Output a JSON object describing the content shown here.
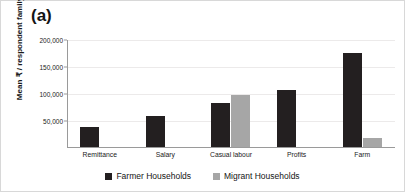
{
  "figure": {
    "panel_label": "(a)"
  },
  "chart_data": {
    "type": "bar",
    "title": "",
    "subtitle": "",
    "panel": "(a)",
    "xlabel": "",
    "ylabel": "Mean ₹ / respondent family",
    "categories": [
      "Remittance",
      "Salary",
      "Casual labour",
      "Profits",
      "Farm"
    ],
    "series": [
      {
        "name": "Farmer Households",
        "color": "#231f20",
        "values": [
          38000,
          59000,
          84000,
          108000,
          176000
        ]
      },
      {
        "name": "Migrant Households",
        "color": "#a6a6a6",
        "values": [
          null,
          null,
          99000,
          null,
          18000
        ]
      }
    ],
    "ylim": [
      0,
      200000
    ],
    "yticks": [
      0,
      50000,
      100000,
      150000,
      200000
    ],
    "ytick_labels": [
      "",
      "50,000",
      "100,000",
      "150,000",
      "200,000"
    ],
    "grid": true,
    "grid_axis": "y",
    "legend_position": "bottom-center",
    "legend_entries": [
      "Farmer Households",
      "Migrant Households"
    ],
    "annotations": []
  },
  "legend": {
    "items": [
      {
        "label": "Farmer Households",
        "color": "#231f20"
      },
      {
        "label": "Migrant Households",
        "color": "#a6a6a6"
      }
    ]
  },
  "axis": {
    "y_title": "Mean ₹ / respondent family",
    "ticks": [
      {
        "label": "200,000",
        "value": 200000
      },
      {
        "label": "150,000",
        "value": 150000
      },
      {
        "label": "100,000",
        "value": 100000
      },
      {
        "label": "50,000",
        "value": 50000
      }
    ]
  }
}
